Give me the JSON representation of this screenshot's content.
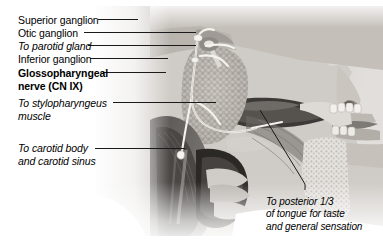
{
  "figure": {
    "style": "grayscale anatomical illustration, lateral view of head and neck"
  },
  "labels": {
    "superior_ganglion": "Superior ganglion",
    "otic_ganglion": "Otic ganglion",
    "to_parotid_gland": "To parotid gland",
    "inferior_ganglion": "Inferior ganglion",
    "nerve_line1": "Glossopharyngeal",
    "nerve_line2": "nerve (CN IX)",
    "stylopharyngeus_line1": "To stylopharyngeus",
    "stylopharyngeus_line2": "muscle",
    "carotid_line1": "To carotid body",
    "carotid_line2": "and carotid sinus",
    "tongue_line1": "To posterior 1/3",
    "tongue_line2": "of tongue for taste",
    "tongue_line3": "and general sensation"
  },
  "colors": {
    "background": "#ffffff",
    "text": "#000000",
    "leader_line": "#1a1a1a",
    "skin_light": "#d8d4d0",
    "skin_mid": "#b3aeaa",
    "tissue_dark": "#4a4845",
    "tissue_darkest": "#24231f",
    "bone_light": "#e6e3df",
    "nerve_highlight": "#f2f0ec"
  }
}
